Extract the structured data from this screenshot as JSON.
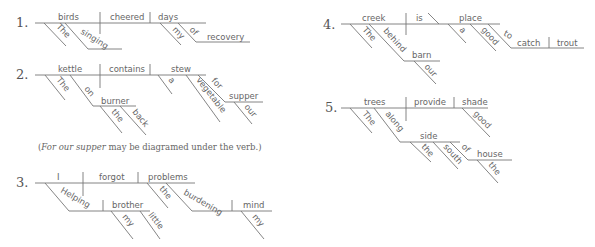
{
  "diagrams": [
    {
      "number": "1.",
      "subject": "birds",
      "verb": "cheered",
      "object": "days",
      "modifiers": {
        "subject": [
          "The",
          "singing"
        ],
        "object": [
          "my",
          "of"
        ],
        "prep_object": "recovery"
      }
    },
    {
      "number": "2.",
      "subject": "kettle",
      "verb": "contains",
      "object": "stew",
      "modifiers": {
        "subject": [
          "The",
          "on"
        ],
        "on_object": "burner",
        "burner_mods": [
          "the",
          "back"
        ],
        "object": [
          "a",
          "vegetable",
          "for"
        ],
        "for_object": "supper",
        "supper_mods": [
          "our"
        ]
      },
      "note": {
        "italic": "For our supper",
        "rest": " may be diagramed under the verb.)",
        "open": "("
      }
    },
    {
      "number": "3.",
      "subject": "I",
      "verb": "forgot",
      "object": "problems",
      "modifiers": {
        "subject_participle": "Helping",
        "participle_object": "brother",
        "brother_mods": [
          "my",
          "little"
        ],
        "object": [
          "the",
          "burdening"
        ],
        "burdening_object": "mind",
        "mind_mods": [
          "my"
        ]
      }
    },
    {
      "number": "4.",
      "subject": "creek",
      "verb": "is",
      "complement": "place",
      "modifiers": {
        "subject": [
          "The",
          "behind"
        ],
        "behind_object": "barn",
        "barn_mods": [
          "our"
        ],
        "complement": [
          "a",
          "good",
          "to"
        ],
        "infinitive": "catch",
        "infinitive_object": "trout"
      }
    },
    {
      "number": "5.",
      "subject": "trees",
      "verb": "provide",
      "object": "shade",
      "modifiers": {
        "subject": [
          "The",
          "along"
        ],
        "along_object": "side",
        "side_mods": [
          "the",
          "south",
          "of"
        ],
        "of_object": "house",
        "house_mods": [
          "the"
        ],
        "object": [
          "good"
        ]
      }
    }
  ]
}
